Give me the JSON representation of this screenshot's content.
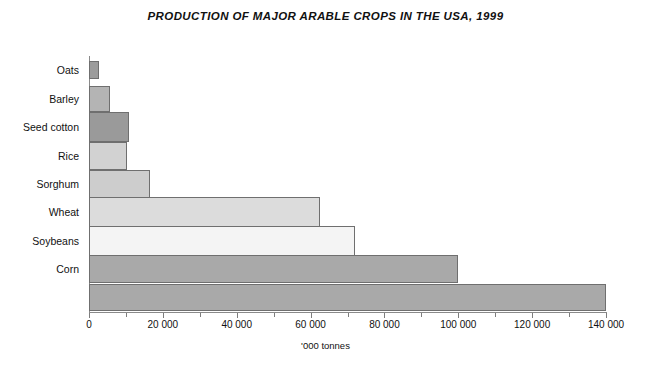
{
  "chart_data": {
    "type": "bar",
    "orientation": "horizontal",
    "title": "PRODUCTION OF MAJOR ARABLE CROPS IN THE USA, 1999",
    "xlabel": "'000 tonnes",
    "ylabel": "",
    "xlim": [
      0,
      140000
    ],
    "xticks": [
      0,
      20000,
      40000,
      60000,
      80000,
      100000,
      120000,
      140000
    ],
    "xticklabels": [
      "0",
      "20 000",
      "40 000",
      "60 000",
      "80 000",
      "100 000",
      "120 000",
      "140 000"
    ],
    "minor_tick_step": 10000,
    "grid": false,
    "legend": false,
    "categories": [
      "Oats",
      "Barley",
      "Seed cotton",
      "Rice",
      "Sorghum",
      "Wheat",
      "Soybeans",
      "Corn"
    ],
    "values": [
      2700,
      5700,
      10800,
      10300,
      16500,
      62500,
      72000,
      140000
    ],
    "bars": [
      {
        "label": "Oats",
        "value": 2700,
        "fill": "#9c9c9c",
        "stroke": "#6f6f6f",
        "height_px": 18,
        "width_px": 10
      },
      {
        "label": "Barley",
        "value": 5700,
        "fill": "#b4b4b4",
        "stroke": "#6f6f6f",
        "height_px": 26,
        "width_px": 21
      },
      {
        "label": "Seed cotton",
        "value": 10800,
        "fill": "#9a9a9a",
        "stroke": "#6f6f6f",
        "height_px": 30,
        "width_px": 40
      },
      {
        "label": "Rice",
        "value": 10300,
        "fill": "#d2d2d2",
        "stroke": "#6f6f6f",
        "height_px": 28,
        "width_px": 38
      },
      {
        "label": "Sorghum",
        "value": 16500,
        "fill": "#cdcdcd",
        "stroke": "#6f6f6f",
        "height_px": 28,
        "width_px": 61
      },
      {
        "label": "Wheat",
        "value": 62500,
        "fill": "#dcdcdc",
        "stroke": "#6f6f6f",
        "height_px": 30,
        "width_px": 235
      },
      {
        "label": "Soybeans",
        "value": 72000,
        "fill": "#f4f4f4",
        "stroke": "#6f6f6f",
        "height_px": 30,
        "width_px": 269
      },
      {
        "label": "Corn",
        "value": 100000,
        "fill": "#a9a9a9",
        "stroke": "#6f6f6f",
        "height_px": 28,
        "width_px": 359
      },
      {
        "label": "",
        "value": 140000,
        "fill": "#a9a9a9",
        "stroke": "#6f6f6f",
        "height_px": 27,
        "width_px": 517
      }
    ]
  },
  "axis": {
    "x_title": "'000 tonnes",
    "tick_labels": [
      "0",
      "20 000",
      "40 000",
      "60 000",
      "80 000",
      "100 000",
      "120 000",
      "140 000"
    ]
  },
  "labels": {
    "oats": "Oats",
    "barley": "Barley",
    "seed_cotton": "Seed cotton",
    "rice": "Rice",
    "sorghum": "Sorghum",
    "wheat": "Wheat",
    "soybeans": "Soybeans",
    "corn": "Corn"
  },
  "colors": {
    "axis": "#8a8a8a",
    "bar_stroke": "#6f6f6f",
    "text": "#111111",
    "background": "#ffffff"
  }
}
